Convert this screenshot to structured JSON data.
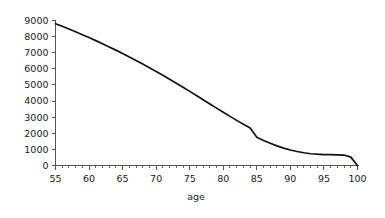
{
  "chart_data": {
    "type": "line",
    "title": "",
    "subtitle": "",
    "xlabel": "age",
    "ylabel": "",
    "xlim": [
      55,
      100
    ],
    "ylim": [
      0,
      9000
    ],
    "grid": false,
    "legend": "none",
    "x_ticks": [
      55,
      60,
      65,
      70,
      75,
      80,
      85,
      90,
      95,
      100
    ],
    "x_tick_labels": [
      "55",
      "60",
      "65",
      "70",
      "75",
      "80",
      "85",
      "90",
      "95",
      "100"
    ],
    "x_minor_tick_step": 1,
    "y_ticks": [
      0,
      1000,
      2000,
      3000,
      4000,
      5000,
      6000,
      7000,
      8000,
      9000
    ],
    "y_tick_labels": [
      "0",
      "1000",
      "2000",
      "3000",
      "4000",
      "5000",
      "6000",
      "7000",
      "8000",
      "9000"
    ],
    "line_color": "#111111",
    "axis_color": "#555555",
    "background_color": "#ffffff",
    "series": [
      {
        "name": "survivors",
        "x": [
          55,
          56,
          57,
          58,
          59,
          60,
          61,
          62,
          63,
          64,
          65,
          66,
          67,
          68,
          69,
          70,
          71,
          72,
          73,
          74,
          75,
          76,
          77,
          78,
          79,
          80,
          81,
          82,
          83,
          84,
          85,
          86,
          87,
          88,
          89,
          90,
          91,
          92,
          93,
          94,
          95,
          96,
          97,
          98,
          99,
          100
        ],
        "values": [
          8800,
          8640,
          8470,
          8300,
          8120,
          7940,
          7750,
          7560,
          7360,
          7160,
          6950,
          6740,
          6520,
          6300,
          6070,
          5840,
          5600,
          5360,
          5110,
          4860,
          4600,
          4340,
          4080,
          3820,
          3560,
          3300,
          3050,
          2800,
          2560,
          2330,
          1750,
          1550,
          1380,
          1220,
          1080,
          960,
          870,
          790,
          730,
          700,
          680,
          670,
          660,
          650,
          520,
          0
        ]
      }
    ]
  },
  "axis_title": {
    "x": "age"
  }
}
